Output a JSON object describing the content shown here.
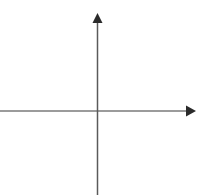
{
  "figure": {
    "title": "",
    "width": 203,
    "height": 195,
    "background_color": "#ffffff",
    "has_border": false,
    "has_gridlines": false,
    "has_tick_labels": false,
    "has_axis_labels": false,
    "has_legend": false,
    "has_plotted_data": false
  },
  "chart_data": {
    "type": "line",
    "title": "",
    "subtitle": "",
    "xlabel": "",
    "ylabel": "",
    "x": [],
    "series": [],
    "categories": [],
    "values": [],
    "xticks": [],
    "yticks": [],
    "xticklabels": [],
    "yticklabels": [],
    "xlim": [
      -97,
      106
    ],
    "ylim": [
      -84,
      111
    ],
    "grid": false,
    "legend": false,
    "legend_position": "none",
    "annotations": [],
    "origin": {
      "x": 97,
      "y": 111
    }
  },
  "axes": {
    "x_axis": {
      "name": "x-axis",
      "orientation": "horizontal",
      "color": "#7a7a7a",
      "stroke_width": 1.4,
      "start_x": 0,
      "end_x": 187,
      "y": 111,
      "arrow": {
        "name": "x-axis-arrowhead",
        "direction": "right",
        "color": "#2b2b2b",
        "tip_x": 196,
        "tip_y": 111,
        "base_x": 186,
        "half_height": 5.5
      }
    },
    "y_axis": {
      "name": "y-axis",
      "orientation": "vertical",
      "color": "#5a5a5a",
      "stroke_width": 1.5,
      "x": 97.5,
      "start_y": 22,
      "end_y": 195,
      "arrow": {
        "name": "y-axis-arrowhead",
        "direction": "up",
        "color": "#2b2b2b",
        "tip_x": 97.5,
        "tip_y": 13,
        "base_y": 23,
        "half_width": 5
      }
    }
  },
  "colors": {
    "background": "#ffffff",
    "x_axis_line": "#7a7a7a",
    "y_axis_line": "#5a5a5a",
    "arrowhead": "#2b2b2b"
  }
}
